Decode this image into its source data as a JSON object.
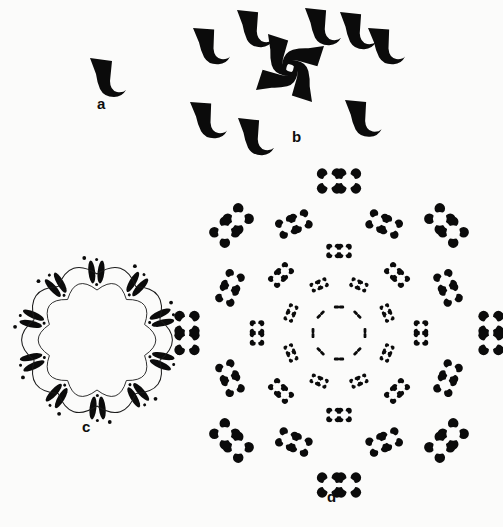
{
  "figure": {
    "background_color": "#fbfbfa",
    "ink_color": "#0b0b0b",
    "width": 503,
    "height": 527
  },
  "panels": [
    {
      "id": "a",
      "label": "a",
      "title": "single motif",
      "motif_count": 1,
      "symmetry": "none",
      "description": "A single solid black comma / hook shaped motif: a wedge-like triangular head at top with a thin tail curving down and to the right."
    },
    {
      "id": "b",
      "label": "b",
      "title": "pinwheel cluster with surrounding motifs",
      "motif_count": 12,
      "core_count": 4,
      "outer_count": 8,
      "symmetry": "4-fold rotational (C4)",
      "description": "A central pinwheel of four motifs arranged with 4-fold rotational symmetry, surrounded by eight free motifs at the periphery."
    },
    {
      "id": "c",
      "label": "c",
      "title": "decamer ring",
      "unit_count": 10,
      "blobs_per_unit": 2,
      "symmetry": "10-fold rotational (C10)",
      "description": "A closed circular ring built from ten repeating units; each unit is a pair of elongated solid blobs linked by fine curved arcs with small arrowheads indicating rotational direction."
    },
    {
      "id": "d",
      "label": "d",
      "title": "concentric rosette lattice",
      "ring_count": 5,
      "pairs_per_ring": 8,
      "symmetry": "8-fold rotational (C8)",
      "description": "Concentric rings of paired four-lobed rosettes. Rosette size grows with radius: a dashed innermost ring of tiny marks expands outward through four further rings of progressively larger rosette pairs.",
      "rings": [
        {
          "index": 0,
          "radius": 26,
          "pair_count": 8,
          "rosette_radius": 2.1,
          "pair_gap": 5
        },
        {
          "index": 1,
          "radius": 52,
          "pair_count": 8,
          "rosette_radius": 3.2,
          "pair_gap": 8
        },
        {
          "index": 2,
          "radius": 82,
          "pair_count": 8,
          "rosette_radius": 4.6,
          "pair_gap": 11
        },
        {
          "index": 3,
          "radius": 118,
          "pair_count": 8,
          "rosette_radius": 6.4,
          "pair_gap": 15
        },
        {
          "index": 4,
          "radius": 152,
          "pair_count": 8,
          "rosette_radius": 8.0,
          "pair_gap": 19
        }
      ]
    }
  ],
  "chart_data": {
    "type": "scatter",
    "title": "",
    "xlabel": "",
    "ylabel": "",
    "series": [
      {
        "name": "a - monomer",
        "values": [
          1
        ]
      },
      {
        "name": "b - core tetramer",
        "values": [
          4
        ]
      },
      {
        "name": "b - peripheral motifs",
        "values": [
          8
        ]
      },
      {
        "name": "c - ring units",
        "values": [
          10
        ]
      },
      {
        "name": "d - rosette pairs per ring",
        "values": [
          8,
          8,
          8,
          8,
          8
        ]
      }
    ]
  }
}
